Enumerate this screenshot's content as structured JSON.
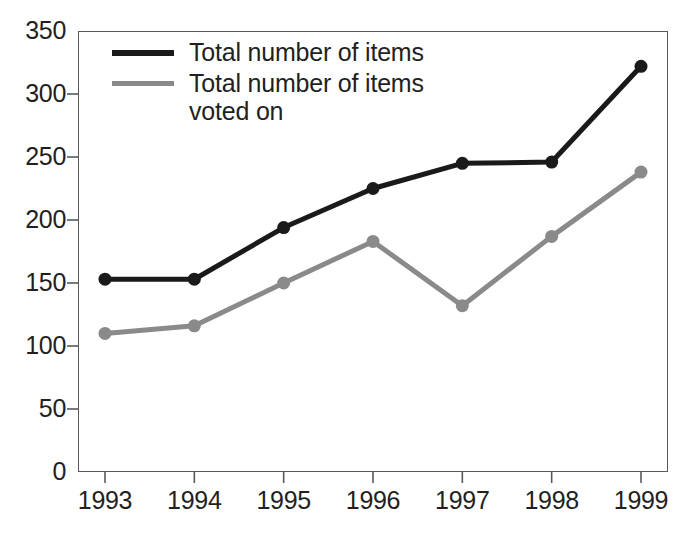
{
  "chart_data": {
    "type": "line",
    "title": "",
    "subtitle": "",
    "xlabel": "",
    "ylabel": "",
    "categories": [
      "1993",
      "1994",
      "1995",
      "1996",
      "1997",
      "1998",
      "1999"
    ],
    "x": [
      1993,
      1994,
      1995,
      1996,
      1997,
      1998,
      1999
    ],
    "series": [
      {
        "name": "Total number of items",
        "color": "#1a1a1a",
        "marker": "circle",
        "values": [
          153,
          153,
          194,
          225,
          245,
          246,
          322
        ]
      },
      {
        "name": "Total number of items voted on",
        "color": "#8a8a8a",
        "marker": "circle",
        "values": [
          110,
          116,
          150,
          183,
          132,
          187,
          238
        ]
      }
    ],
    "ylim": [
      0,
      350
    ],
    "yticks": [
      0,
      50,
      100,
      150,
      200,
      250,
      300,
      350
    ],
    "ytick_labels": [
      "0",
      "50",
      "100",
      "150",
      "200",
      "250",
      "300",
      "350"
    ],
    "xtick_labels": [
      "1993",
      "1994",
      "1995",
      "1996",
      "1997",
      "1998",
      "1999"
    ],
    "grid": false,
    "legend_position": "top-left",
    "legend": [
      "Total number of items",
      "Total number of items\nvoted on"
    ]
  },
  "colors": {
    "series_primary": "#1a1a1a",
    "series_secondary": "#8a8a8a",
    "axis": "#58595b",
    "text": "#231f20",
    "background": "#ffffff"
  }
}
